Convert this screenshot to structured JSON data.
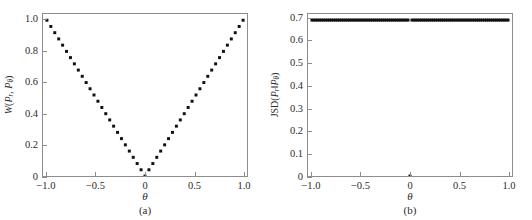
{
  "figure": {
    "background_color": "#ffffff",
    "axis_color": "#8d8d8d",
    "marker_color": "#111111"
  },
  "panels": [
    {
      "id": "a",
      "caption": "(a)",
      "xlabel": "θ",
      "ylabel_parts": {
        "func": "W",
        "open": "(",
        "p1": "P",
        "p1sub": "r",
        "sep": ", ",
        "p2": "P",
        "p2sub": "θ",
        "close": ")"
      },
      "ylabel_text": "W(P_r, P_θ)",
      "xticks": [
        "−1.0",
        "−0.5",
        "0",
        "0.5",
        "1.0"
      ],
      "xtick_values": [
        -1.0,
        -0.5,
        0,
        0.5,
        1.0
      ],
      "yticks": [
        "0",
        "0.2",
        "0.4",
        "0.6",
        "0.8",
        "1.0"
      ],
      "ytick_values": [
        0,
        0.2,
        0.4,
        0.6,
        0.8,
        1.0
      ]
    },
    {
      "id": "b",
      "caption": "(b)",
      "xlabel": "θ",
      "ylabel_parts": {
        "func": "JSD",
        "open": "(",
        "p1": "P",
        "p1sub": "r",
        "sep": "‖",
        "p2": "P",
        "p2sub": "θ",
        "close": ")"
      },
      "ylabel_text": "JSD(P_r‖P_θ)",
      "xticks": [
        "−1.0",
        "−0.5",
        "0",
        "0.5",
        "1.0"
      ],
      "xtick_values": [
        -1.0,
        -0.5,
        0,
        0.5,
        1.0
      ],
      "yticks": [
        "0",
        "0.1",
        "0.2",
        "0.3",
        "0.4",
        "0.5",
        "0.6",
        "0.7"
      ],
      "ytick_values": [
        0,
        0.1,
        0.2,
        0.3,
        0.4,
        0.5,
        0.6,
        0.7
      ]
    }
  ],
  "chart_data": [
    {
      "type": "scatter",
      "title": "",
      "panel": "(a)",
      "xlabel": "θ",
      "ylabel": "W(P_r, P_θ)",
      "xlim": [
        -1.04,
        1.04
      ],
      "ylim": [
        0.0,
        1.04
      ],
      "grid": false,
      "legend": "none",
      "marker": "square",
      "description": "Wasserstein distance is the absolute value |θ|, forming a continuous V shape with minimum 0 at θ = 0.",
      "x": [
        -1.0,
        -0.96,
        -0.92,
        -0.88,
        -0.84,
        -0.8,
        -0.76,
        -0.72,
        -0.68,
        -0.64,
        -0.6,
        -0.56,
        -0.52,
        -0.48,
        -0.44,
        -0.4,
        -0.36,
        -0.32,
        -0.28,
        -0.24,
        -0.2,
        -0.16,
        -0.12,
        -0.08,
        -0.04,
        0.0,
        0.04,
        0.08,
        0.12,
        0.16,
        0.2,
        0.24,
        0.28,
        0.32,
        0.36,
        0.4,
        0.44,
        0.48,
        0.52,
        0.56,
        0.6,
        0.64,
        0.68,
        0.72,
        0.76,
        0.8,
        0.84,
        0.88,
        0.92,
        0.96,
        1.0
      ],
      "y": [
        1.0,
        0.96,
        0.92,
        0.88,
        0.84,
        0.8,
        0.76,
        0.72,
        0.68,
        0.64,
        0.6,
        0.56,
        0.52,
        0.48,
        0.44,
        0.4,
        0.36,
        0.32,
        0.28,
        0.24,
        0.2,
        0.16,
        0.12,
        0.08,
        0.04,
        0.0,
        0.04,
        0.08,
        0.12,
        0.16,
        0.2,
        0.24,
        0.28,
        0.32,
        0.36,
        0.4,
        0.44,
        0.48,
        0.52,
        0.56,
        0.6,
        0.64,
        0.68,
        0.72,
        0.76,
        0.8,
        0.84,
        0.88,
        0.92,
        0.96,
        1.0
      ]
    },
    {
      "type": "scatter",
      "title": "",
      "panel": "(b)",
      "xlabel": "θ",
      "ylabel": "JSD(P_r‖P_θ)",
      "xlim": [
        -1.04,
        1.04
      ],
      "ylim": [
        0.0,
        0.72
      ],
      "grid": false,
      "legend": "none",
      "marker": "square",
      "description": "Jensen-Shannon divergence is constant at log 2 ≈ 0.693 for all θ ≠ 0, and drops discontinuously to 0 at θ = 0.",
      "constant_value": 0.693,
      "discontinuity_x": 0.0,
      "discontinuity_y": 0.0,
      "x": [
        -1.0,
        -0.98,
        -0.96,
        -0.94,
        -0.92,
        -0.9,
        -0.88,
        -0.86,
        -0.84,
        -0.82,
        -0.8,
        -0.78,
        -0.76,
        -0.74,
        -0.72,
        -0.7,
        -0.68,
        -0.66,
        -0.64,
        -0.62,
        -0.6,
        -0.58,
        -0.56,
        -0.54,
        -0.52,
        -0.5,
        -0.48,
        -0.46,
        -0.44,
        -0.42,
        -0.4,
        -0.38,
        -0.36,
        -0.34,
        -0.32,
        -0.3,
        -0.28,
        -0.26,
        -0.24,
        -0.22,
        -0.2,
        -0.18,
        -0.16,
        -0.14,
        -0.12,
        -0.1,
        -0.08,
        -0.06,
        -0.04,
        -0.02,
        0.0,
        0.02,
        0.04,
        0.06,
        0.08,
        0.1,
        0.12,
        0.14,
        0.16,
        0.18,
        0.2,
        0.22,
        0.24,
        0.26,
        0.28,
        0.3,
        0.32,
        0.34,
        0.36,
        0.38,
        0.4,
        0.42,
        0.44,
        0.46,
        0.48,
        0.5,
        0.52,
        0.54,
        0.56,
        0.58,
        0.6,
        0.62,
        0.64,
        0.66,
        0.68,
        0.7,
        0.72,
        0.74,
        0.76,
        0.78,
        0.8,
        0.82,
        0.84,
        0.86,
        0.88,
        0.9,
        0.92,
        0.94,
        0.96,
        0.98,
        1.0
      ],
      "y": [
        0.693,
        0.693,
        0.693,
        0.693,
        0.693,
        0.693,
        0.693,
        0.693,
        0.693,
        0.693,
        0.693,
        0.693,
        0.693,
        0.693,
        0.693,
        0.693,
        0.693,
        0.693,
        0.693,
        0.693,
        0.693,
        0.693,
        0.693,
        0.693,
        0.693,
        0.693,
        0.693,
        0.693,
        0.693,
        0.693,
        0.693,
        0.693,
        0.693,
        0.693,
        0.693,
        0.693,
        0.693,
        0.693,
        0.693,
        0.693,
        0.693,
        0.693,
        0.693,
        0.693,
        0.693,
        0.693,
        0.693,
        0.693,
        0.693,
        0.693,
        0.0,
        0.693,
        0.693,
        0.693,
        0.693,
        0.693,
        0.693,
        0.693,
        0.693,
        0.693,
        0.693,
        0.693,
        0.693,
        0.693,
        0.693,
        0.693,
        0.693,
        0.693,
        0.693,
        0.693,
        0.693,
        0.693,
        0.693,
        0.693,
        0.693,
        0.693,
        0.693,
        0.693,
        0.693,
        0.693,
        0.693,
        0.693,
        0.693,
        0.693,
        0.693,
        0.693,
        0.693,
        0.693,
        0.693,
        0.693,
        0.693,
        0.693,
        0.693,
        0.693,
        0.693,
        0.693,
        0.693,
        0.693,
        0.693,
        0.693,
        0.693
      ]
    }
  ]
}
